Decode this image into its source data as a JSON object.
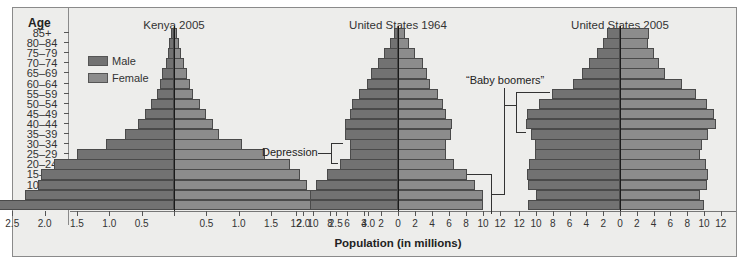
{
  "chart_data": {
    "type": "bar",
    "subtype": "population-pyramid",
    "xlabel": "Population (in millions)",
    "ylabel": "Age",
    "categories": [
      "85+",
      "80–84",
      "75–79",
      "70–74",
      "65–69",
      "60–64",
      "55–59",
      "50–54",
      "45–49",
      "40–44",
      "35–39",
      "30–34",
      "25–29",
      "20–24",
      "15–19",
      "10–14",
      "5–9",
      "0–4"
    ],
    "legend": [
      {
        "name": "Male",
        "color": "#727272"
      },
      {
        "name": "Female",
        "color": "#8c8c8c"
      }
    ],
    "legend_position": "upper-left (inside Kenya panel)",
    "grid": false,
    "panels": [
      {
        "title": "Kenya 2005",
        "xlim": [
          3.0,
          3.0
        ],
        "xticks_left": [
          "3.0",
          "2.5",
          "2.0",
          "1.5",
          "1.0",
          "0.5"
        ],
        "xticks_right": [
          "0.5",
          "1.0",
          "1.5",
          "2.0",
          "2.5",
          "3.0"
        ],
        "series": [
          {
            "name": "Male",
            "values": [
              0.05,
              0.07,
              0.1,
              0.13,
              0.18,
              0.22,
              0.27,
              0.35,
              0.45,
              0.55,
              0.75,
              1.05,
              1.5,
              1.85,
              2.05,
              2.1,
              2.3,
              2.9
            ]
          },
          {
            "name": "Female",
            "values": [
              0.05,
              0.08,
              0.11,
              0.15,
              0.2,
              0.25,
              0.3,
              0.4,
              0.5,
              0.6,
              0.7,
              1.05,
              1.4,
              1.8,
              1.95,
              2.05,
              2.2,
              2.85
            ]
          }
        ]
      },
      {
        "title": "United States 1964",
        "xlim": [
          12,
          12
        ],
        "xticks_left": [
          "12",
          "10",
          "8",
          "6",
          "4",
          "2",
          "0"
        ],
        "xticks_right": [
          "2",
          "4",
          "6",
          "8",
          "10",
          "12"
        ],
        "series": [
          {
            "name": "Male",
            "values": [
              0.5,
              0.9,
              1.6,
              2.4,
              3.2,
              3.7,
              4.6,
              5.4,
              5.7,
              6.2,
              6.2,
              5.7,
              5.6,
              6.8,
              8.4,
              9.6,
              10.3,
              10.4
            ]
          },
          {
            "name": "Female",
            "values": [
              0.8,
              1.3,
              2.0,
              2.9,
              3.4,
              3.8,
              4.7,
              5.3,
              5.7,
              6.3,
              6.2,
              5.7,
              5.7,
              6.6,
              8.1,
              9.1,
              10.0,
              10.0
            ]
          }
        ]
      },
      {
        "title": "United States 2005",
        "xlim": [
          12,
          12
        ],
        "xticks_left": [
          "12",
          "10",
          "8",
          "6",
          "4",
          "2",
          "0"
        ],
        "xticks_right": [
          "2",
          "4",
          "6",
          "8",
          "10",
          "12"
        ],
        "series": [
          {
            "name": "Male",
            "values": [
              1.5,
              2.0,
              2.7,
              3.7,
              4.5,
              5.6,
              8.1,
              9.6,
              11.1,
              11.2,
              10.6,
              10.1,
              10.1,
              10.8,
              11.1,
              10.9,
              10.0,
              10.9
            ]
          },
          {
            "name": "Female",
            "values": [
              3.4,
              3.3,
              4.1,
              4.7,
              5.4,
              7.4,
              9.0,
              10.3,
              11.2,
              11.4,
              10.5,
              9.8,
              9.5,
              10.2,
              10.5,
              10.3,
              9.5,
              10.0
            ]
          }
        ]
      }
    ],
    "annotations": [
      {
        "text": "Depression",
        "target": "United States 1964, ages 25–34"
      },
      {
        "text": "“Baby boomers”",
        "target": "United States 1964 ages 0–19 and United States 2005 ages 40–59"
      }
    ]
  },
  "labels": {
    "age_header": "Age",
    "x_axis_title": "Population (in millions)",
    "legend_male": "Male",
    "legend_female": "Female",
    "panel_titles": [
      "Kenya 2005",
      "United States 1964",
      "United States 2005"
    ],
    "annotation_depression": "Depression",
    "annotation_boomers": "“Baby boomers”"
  }
}
